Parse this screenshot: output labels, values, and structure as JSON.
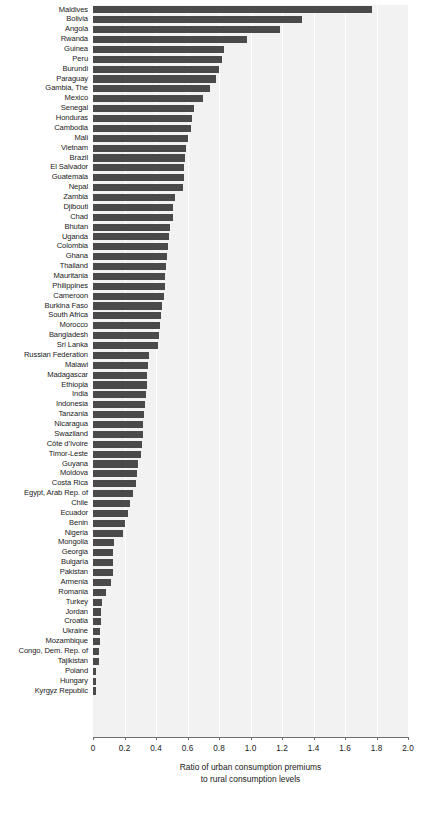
{
  "chart_data": {
    "type": "bar",
    "orientation": "horizontal",
    "title": "",
    "xlabel": "Ratio of urban consumption premiums to rural consumption levels",
    "xlabel_line1": "Ratio of urban consumption premiums",
    "xlabel_line2": "to rural consumption levels",
    "ylabel": "",
    "xlim": [
      0,
      2.0
    ],
    "xticks": [
      0,
      0.2,
      0.4,
      0.6,
      0.8,
      1.0,
      1.2,
      1.4,
      1.6,
      1.8,
      2.0
    ],
    "xtick_labels": [
      "0",
      "0.2",
      "0.4",
      "0.6",
      "0.8",
      "1.0",
      "1.2",
      "1.4",
      "1.6",
      "1.8",
      "2.0"
    ],
    "grid": "vertical-white-on-gray",
    "legend": "none",
    "bar_color": "#4a4a4a",
    "plot_background": "#f2f2f2",
    "categories": [
      "Maldives",
      "Bolivia",
      "Angola",
      "Rwanda",
      "Guinea",
      "Peru",
      "Burundi",
      "Paraguay",
      "Gambia, The",
      "Mexico",
      "Senegal",
      "Honduras",
      "Cambodia",
      "Mali",
      "Vietnam",
      "Brazil",
      "El Salvador",
      "Guatemala",
      "Nepal",
      "Zambia",
      "Djibouti",
      "Chad",
      "Bhutan",
      "Uganda",
      "Colombia",
      "Ghana",
      "Thailand",
      "Mauritania",
      "Philippines",
      "Cameroon",
      "Burkina Faso",
      "South Africa",
      "Morocco",
      "Bangladesh",
      "Sri Lanka",
      "Russian Federation",
      "Malawi",
      "Madagascar",
      "Ethiopia",
      "India",
      "Indonesia",
      "Tanzania",
      "Nicaragua",
      "Swaziland",
      "Côte d’Ivoire",
      "Timor-Leste",
      "Guyana",
      "Moldova",
      "Costa Rica",
      "Egypt, Arab Rep. of",
      "Chile",
      "Ecuador",
      "Benin",
      "Nigeria",
      "Mongolia",
      "Georgia",
      "Bulgaria",
      "Pakistan",
      "Armenia",
      "Romania",
      "Turkey",
      "Jordan",
      "Croatia",
      "Ukraine",
      "Mozambique",
      "Congo, Dem. Rep. of",
      "Tajikistan",
      "Poland",
      "Hungary",
      "Kyrgyz Republic"
    ],
    "values": [
      1.77,
      1.33,
      1.19,
      0.98,
      0.83,
      0.82,
      0.8,
      0.78,
      0.74,
      0.7,
      0.64,
      0.63,
      0.62,
      0.6,
      0.59,
      0.585,
      0.58,
      0.575,
      0.57,
      0.52,
      0.51,
      0.505,
      0.49,
      0.485,
      0.475,
      0.47,
      0.465,
      0.46,
      0.455,
      0.45,
      0.435,
      0.43,
      0.425,
      0.42,
      0.415,
      0.355,
      0.35,
      0.345,
      0.34,
      0.335,
      0.33,
      0.325,
      0.32,
      0.315,
      0.31,
      0.305,
      0.285,
      0.28,
      0.275,
      0.255,
      0.235,
      0.22,
      0.205,
      0.19,
      0.135,
      0.13,
      0.128,
      0.125,
      0.115,
      0.08,
      0.06,
      0.05,
      0.048,
      0.046,
      0.045,
      0.038,
      0.035,
      0.022,
      0.02,
      0.018
    ]
  }
}
